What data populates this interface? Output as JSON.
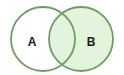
{
  "diagram": {
    "type": "venn",
    "sets": [
      {
        "id": "A",
        "label": "A",
        "fill": "#ffffff",
        "shaded": false
      },
      {
        "id": "B",
        "label": "B",
        "fill": "#e2f5dc",
        "shaded": true
      }
    ],
    "intersection": {
      "shaded": true,
      "fill": "#e2f5dc"
    },
    "colors": {
      "stroke": "#6e9c63",
      "shade": "#e2f5dc",
      "background": "#ffffff",
      "label": "#1a1a1a"
    }
  }
}
